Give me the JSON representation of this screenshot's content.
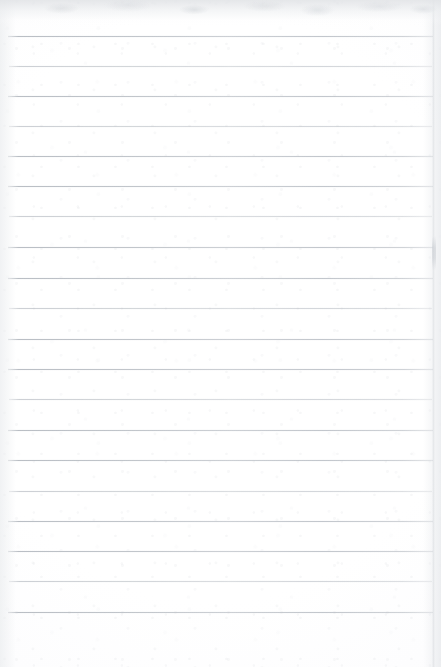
{
  "document": {
    "kind": "scanned-lined-notebook-page",
    "title": "Blank Lined Notebook Page",
    "page_width": 441,
    "page_height": 667,
    "paper_color": "#ffffff",
    "rule_color": "#b6bbc2",
    "text_content": "",
    "has_handwriting": false,
    "has_printed_text": false,
    "has_margin_rule": false
  },
  "ruling": {
    "style": "wide-ruled-horizontal",
    "line_count": 20,
    "line_spacing_px": 30.3,
    "first_line_y": 36,
    "last_line_y": 612,
    "line_start_x": 8,
    "line_end_x": 433,
    "line_thickness_px": 1,
    "lines": [
      {
        "index": 1,
        "y": 36,
        "x1": 8,
        "x2": 433,
        "weight": "bold"
      },
      {
        "index": 2,
        "y": 66,
        "x1": 9,
        "x2": 432,
        "weight": "faint"
      },
      {
        "index": 3,
        "y": 96,
        "x1": 8,
        "x2": 433,
        "weight": "bold"
      },
      {
        "index": 4,
        "y": 126,
        "x1": 9,
        "x2": 432,
        "weight": "faint"
      },
      {
        "index": 5,
        "y": 156,
        "x1": 8,
        "x2": 433,
        "weight": "bold"
      },
      {
        "index": 6,
        "y": 186,
        "x1": 8,
        "x2": 433,
        "weight": "bold"
      },
      {
        "index": 7,
        "y": 216,
        "x1": 9,
        "x2": 432,
        "weight": "faint"
      },
      {
        "index": 8,
        "y": 247,
        "x1": 8,
        "x2": 433,
        "weight": "bold"
      },
      {
        "index": 9,
        "y": 278,
        "x1": 8,
        "x2": 433,
        "weight": "bold"
      },
      {
        "index": 10,
        "y": 308,
        "x1": 9,
        "x2": 432,
        "weight": "faint"
      },
      {
        "index": 11,
        "y": 339,
        "x1": 8,
        "x2": 433,
        "weight": "bold"
      },
      {
        "index": 12,
        "y": 369,
        "x1": 8,
        "x2": 433,
        "weight": "bold"
      },
      {
        "index": 13,
        "y": 399,
        "x1": 9,
        "x2": 432,
        "weight": "faint"
      },
      {
        "index": 14,
        "y": 430,
        "x1": 8,
        "x2": 433,
        "weight": "bold"
      },
      {
        "index": 15,
        "y": 460,
        "x1": 8,
        "x2": 433,
        "weight": "bold"
      },
      {
        "index": 16,
        "y": 491,
        "x1": 9,
        "x2": 432,
        "weight": "faint"
      },
      {
        "index": 17,
        "y": 521,
        "x1": 8,
        "x2": 433,
        "weight": "bold"
      },
      {
        "index": 18,
        "y": 551,
        "x1": 8,
        "x2": 433,
        "weight": "bold"
      },
      {
        "index": 19,
        "y": 581,
        "x1": 9,
        "x2": 432,
        "weight": "faint"
      },
      {
        "index": 20,
        "y": 612,
        "x1": 8,
        "x2": 433,
        "weight": "bold"
      }
    ]
  },
  "scan_artifacts": {
    "top_band_height": 26,
    "left_edge_shadow_width": 16,
    "right_edge_shadow_width": 18,
    "right_crease_x": 434,
    "right_crease_spot_y": 236,
    "vignette": true,
    "grain": true
  }
}
